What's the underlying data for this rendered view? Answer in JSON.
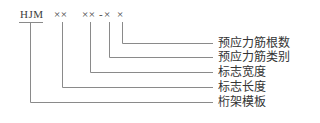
{
  "diagram": {
    "type": "designation-code-breakdown",
    "code_parts": [
      {
        "id": "prefix",
        "text": "HJM"
      },
      {
        "id": "length",
        "text": "××"
      },
      {
        "id": "width",
        "text": "××"
      },
      {
        "id": "dash",
        "text": "-"
      },
      {
        "id": "tendon_type",
        "text": "×"
      },
      {
        "id": "tendon_count",
        "text": "×"
      }
    ],
    "labels": [
      {
        "id": "tendon_count",
        "text": "预应力筋根数"
      },
      {
        "id": "tendon_type",
        "text": "预应力筋类别"
      },
      {
        "id": "width",
        "text": "标志宽度"
      },
      {
        "id": "length",
        "text": "标志长度"
      },
      {
        "id": "prefix",
        "text": "桁架模板"
      }
    ],
    "line_color": "#8a8a8a"
  }
}
